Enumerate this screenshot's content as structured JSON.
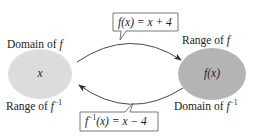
{
  "diagram": {
    "type": "function-inverse-mapping",
    "colors": {
      "domain_oval": "#dcdcdc",
      "range_oval": "#b4b4b4",
      "stroke": "#333333",
      "text": "#222222",
      "background": "#ffffff"
    },
    "left_set": {
      "top_label_prefix": "Domain of ",
      "top_label_symbol": "f",
      "bottom_label_prefix": "Range of ",
      "bottom_label_symbol": "f",
      "bottom_label_superscript": "−1",
      "element": "x"
    },
    "right_set": {
      "top_label_prefix": "Range of ",
      "top_label_symbol": "f",
      "bottom_label_prefix": "Domain of ",
      "bottom_label_symbol": "f",
      "bottom_label_superscript": "−1",
      "element": "f(x)"
    },
    "forward_mapping": {
      "direction": "left-to-right",
      "label_fn": "f",
      "label_arg": "(x)",
      "label_rhs": " = x + 4"
    },
    "inverse_mapping": {
      "direction": "right-to-left",
      "label_fn": "f",
      "label_sup": "−1",
      "label_arg": "(x)",
      "label_rhs": " = x − 4"
    }
  }
}
